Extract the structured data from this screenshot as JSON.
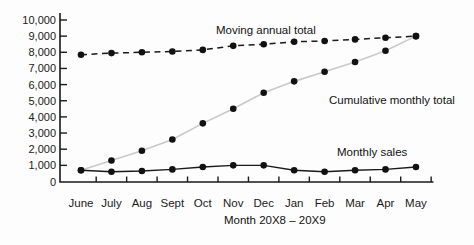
{
  "chart_data": {
    "type": "line",
    "categories": [
      "June",
      "July",
      "Aug",
      "Sept",
      "Oct",
      "Nov",
      "Dec",
      "Jan",
      "Feb",
      "Mar",
      "Apr",
      "May"
    ],
    "series": [
      {
        "name": "Moving annual total",
        "style": "dashed-black",
        "values": [
          7850,
          7950,
          8000,
          8050,
          8150,
          8400,
          8500,
          8650,
          8700,
          8800,
          8900,
          9000
        ]
      },
      {
        "name": "Cumulative monthly total",
        "style": "gray-line-black-dots",
        "values": [
          700,
          1300,
          1900,
          2600,
          3600,
          4500,
          5500,
          6200,
          6800,
          7400,
          8100,
          9000
        ]
      },
      {
        "name": "Monthly sales",
        "style": "solid-black",
        "values": [
          700,
          600,
          650,
          750,
          900,
          1000,
          1000,
          700,
          600,
          700,
          750,
          900
        ]
      }
    ],
    "title": "",
    "xlabel": "Month 20X8 – 20X9",
    "ylabel": "",
    "ylim": [
      0,
      10000
    ],
    "ytick_step": 1000,
    "ytick_labels": [
      "0",
      "1,000",
      "2,000",
      "3,000",
      "4,000",
      "5,000",
      "6,000",
      "7,000",
      "8,000",
      "9,000",
      "10,000"
    ],
    "grid": "off",
    "legend_position": "inline-annotations",
    "colors": {
      "line_black": "#1a1a1a",
      "cumulative_line_gray": "#c9c9c9",
      "dot_black": "#111111",
      "background": "#fdfdfd"
    }
  }
}
